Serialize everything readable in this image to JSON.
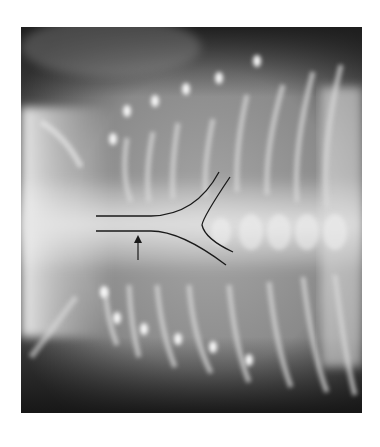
{
  "image": {
    "kind": "radiograph",
    "description": "Chest X-ray with annotated airway bifurcation (trachea and main bronchi outlined) and an arrow",
    "annotation": {
      "arrow": "upward-arrow",
      "outline": "tracheal-bifurcation-outline"
    },
    "colors": {
      "outline": "#1a1a1a",
      "background": "#ffffff"
    }
  }
}
